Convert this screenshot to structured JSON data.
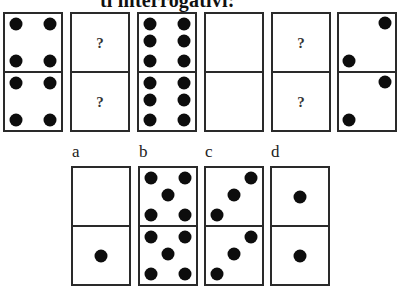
{
  "title": "ti interrogativi:",
  "sequence": [
    {
      "id": "s1",
      "top": {
        "type": "dots",
        "count": 4,
        "dots": [
          [
            20,
            18
          ],
          [
            80,
            18
          ],
          [
            20,
            82
          ],
          [
            80,
            82
          ]
        ]
      },
      "bottom": {
        "type": "dots",
        "count": 4,
        "dots": [
          [
            20,
            18
          ],
          [
            80,
            18
          ],
          [
            20,
            82
          ],
          [
            80,
            82
          ]
        ]
      }
    },
    {
      "id": "s2",
      "top": {
        "type": "question",
        "text": "?"
      },
      "bottom": {
        "type": "question",
        "text": "?"
      }
    },
    {
      "id": "s3",
      "top": {
        "type": "dots",
        "count": 6,
        "dots": [
          [
            20,
            18
          ],
          [
            80,
            18
          ],
          [
            20,
            48
          ],
          [
            80,
            48
          ],
          [
            20,
            82
          ],
          [
            80,
            82
          ]
        ]
      },
      "bottom": {
        "type": "dots",
        "count": 6,
        "dots": [
          [
            20,
            18
          ],
          [
            80,
            18
          ],
          [
            20,
            48
          ],
          [
            80,
            48
          ],
          [
            20,
            82
          ],
          [
            80,
            82
          ]
        ]
      }
    },
    {
      "id": "s4",
      "top": {
        "type": "dots",
        "count": 0,
        "dots": []
      },
      "bottom": {
        "type": "dots",
        "count": 0,
        "dots": []
      }
    },
    {
      "id": "s5",
      "top": {
        "type": "question",
        "text": "?"
      },
      "bottom": {
        "type": "question",
        "text": "?"
      }
    },
    {
      "id": "s6",
      "top": {
        "type": "dots",
        "count": 2,
        "dots": [
          [
            82,
            16
          ],
          [
            18,
            82
          ]
        ]
      },
      "bottom": {
        "type": "dots",
        "count": 2,
        "dots": [
          [
            82,
            16
          ],
          [
            18,
            82
          ]
        ]
      }
    }
  ],
  "options": [
    {
      "label": "a",
      "top": {
        "type": "dots",
        "count": 0,
        "dots": []
      },
      "bottom": {
        "type": "dots",
        "count": 1,
        "dots": [
          [
            50,
            50
          ]
        ]
      }
    },
    {
      "label": "b",
      "top": {
        "type": "dots",
        "count": 5,
        "dots": [
          [
            20,
            18
          ],
          [
            80,
            18
          ],
          [
            50,
            48
          ],
          [
            20,
            82
          ],
          [
            80,
            82
          ]
        ]
      },
      "bottom": {
        "type": "dots",
        "count": 5,
        "dots": [
          [
            20,
            18
          ],
          [
            80,
            18
          ],
          [
            50,
            48
          ],
          [
            20,
            82
          ],
          [
            80,
            82
          ]
        ]
      }
    },
    {
      "label": "c",
      "top": {
        "type": "dots",
        "count": 3,
        "dots": [
          [
            80,
            18
          ],
          [
            50,
            48
          ],
          [
            20,
            82
          ]
        ]
      },
      "bottom": {
        "type": "dots",
        "count": 3,
        "dots": [
          [
            80,
            18
          ],
          [
            50,
            48
          ],
          [
            20,
            82
          ]
        ]
      }
    },
    {
      "label": "d",
      "top": {
        "type": "dots",
        "count": 1,
        "dots": [
          [
            50,
            50
          ]
        ]
      },
      "bottom": {
        "type": "dots",
        "count": 1,
        "dots": [
          [
            50,
            50
          ]
        ]
      }
    }
  ]
}
